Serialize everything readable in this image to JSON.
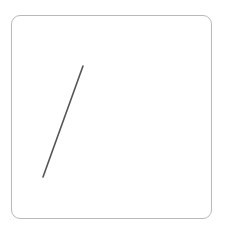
{
  "canvas": {
    "name": "drawing-canvas",
    "width": 226,
    "height": 229,
    "background_color": "#ffffff",
    "panel": {
      "x": 11,
      "y": 15,
      "width": 201,
      "height": 204,
      "fill_color": "#ffffff",
      "border_color": "#b9b9b9",
      "border_width": 1,
      "corner_radius": 9
    }
  },
  "strokes": [
    {
      "name": "diagonal-stroke",
      "type": "line",
      "color": "#555555",
      "width": 1.6,
      "points": [
        {
          "x": 83,
          "y": 66
        },
        {
          "x": 43,
          "y": 177
        }
      ]
    }
  ]
}
